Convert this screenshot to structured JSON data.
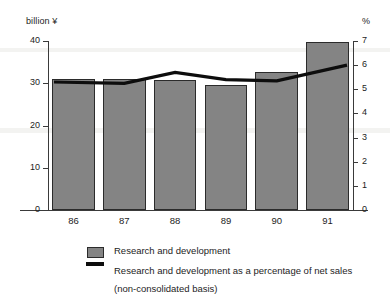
{
  "chart_data": {
    "type": "bar",
    "title": "",
    "subtitle": "",
    "categories": [
      "86",
      "87",
      "88",
      "89",
      "90",
      "91"
    ],
    "xlabel": "",
    "ylabel": "billion ¥",
    "y2label": "%",
    "ylim": [
      0,
      40
    ],
    "y2lim": [
      0,
      7
    ],
    "yticks": [
      "0",
      "10",
      "20",
      "30",
      "40"
    ],
    "ytick_values": [
      0,
      10,
      20,
      30,
      40
    ],
    "y2ticks": [
      "0",
      "1",
      "2",
      "3",
      "4",
      "5",
      "6",
      "7"
    ],
    "y2tick_values": [
      0,
      1,
      2,
      3,
      4,
      5,
      6,
      7
    ],
    "grid": false,
    "legend_position": "bottom",
    "series": [
      {
        "name": "Research and development",
        "kind": "bar",
        "axis": "left",
        "unit": "billion ¥",
        "values": [
          30.9,
          30.9,
          30.8,
          29.6,
          32.7,
          39.8
        ]
      },
      {
        "name": "Research and development as a percentage of net sales (non-consolidated basis)",
        "kind": "line",
        "axis": "right",
        "unit": "%",
        "values": [
          5.3,
          5.25,
          5.7,
          5.4,
          5.35,
          6.0
        ]
      }
    ]
  },
  "legend": {
    "entries": [
      {
        "key": "bar-swatch",
        "label": "Research and development",
        "sublabel": ""
      },
      {
        "key": "line-swatch",
        "label": "Research and development as a percentage of net sales",
        "sublabel": "(non-consolidated basis)"
      }
    ]
  },
  "colors": {
    "bar_fill": "#848484",
    "bar_stroke": "#2b2b2b",
    "line": "#0d0d0d",
    "axis": "#3a3a3a",
    "text": "#1d1d1d",
    "background": "#ffffff"
  }
}
